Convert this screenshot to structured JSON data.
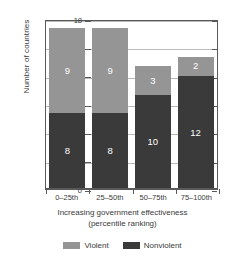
{
  "chart_data": {
    "type": "bar",
    "subtype": "stacked-bar",
    "title": "",
    "xlabel": "Increasing government effectiveness (percentile ranking)",
    "xlabel_line1": "Increasing government effectiveness",
    "xlabel_line2": "(percentile ranking)",
    "ylabel": "Number of countries",
    "categories": [
      "0–25th",
      "25–50th",
      "50–75th",
      "75–100th"
    ],
    "series": [
      {
        "name": "Violent",
        "values": [
          9,
          9,
          3,
          2
        ],
        "color": "#959595"
      },
      {
        "name": "Nonviolent",
        "values": [
          8,
          8,
          10,
          12
        ],
        "color": "#3a3a3a"
      }
    ],
    "stack_order_bottom_to_top": [
      "Nonviolent",
      "Violent"
    ],
    "totals": [
      17,
      17,
      13,
      14
    ],
    "ylim": [
      0,
      18
    ],
    "yticks": [
      0,
      3,
      6,
      9,
      12,
      15,
      18
    ],
    "ytick_labels": [
      "0",
      "3",
      "6",
      "9",
      "12",
      "15",
      "18"
    ],
    "grid": true,
    "grid_axis": "y",
    "legend_position": "bottom",
    "data_labels": true
  },
  "axis": {
    "y_title": "Number of countries",
    "x_title_line1": "Increasing government effectiveness",
    "x_title_line2": "(percentile ranking)"
  },
  "legend": {
    "items": [
      {
        "label": "Violent",
        "color": "#959595"
      },
      {
        "label": "Nonviolent",
        "color": "#3a3a3a"
      }
    ]
  },
  "colors": {
    "violent": "#959595",
    "nonviolent": "#3a3a3a",
    "grid": "#b9b9b9",
    "axis": "#5a5a5a",
    "background": "#ffffff",
    "label_text": "#ffffff"
  }
}
